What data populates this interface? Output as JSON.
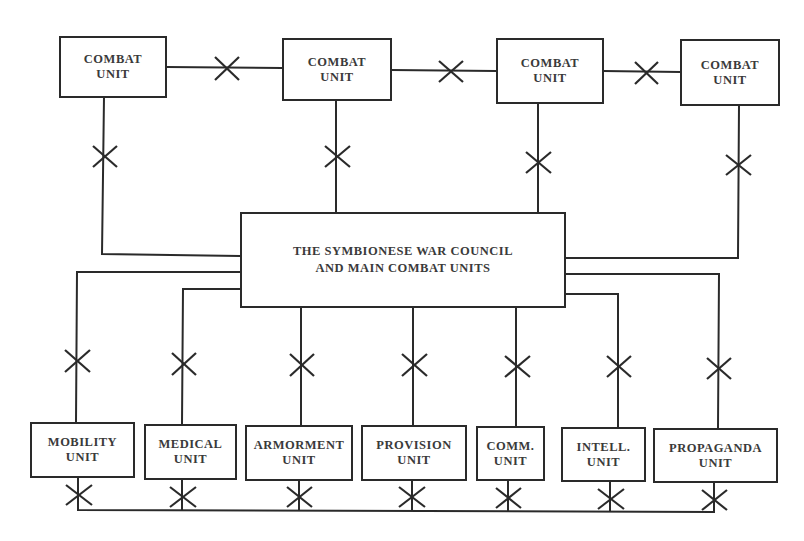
{
  "diagram": {
    "type": "organizational-network",
    "connector_symbol": "X (cut-out / severed link)",
    "colors": {
      "line": "#2a2a2a",
      "text": "#3a3a3a",
      "background": "#ffffff"
    },
    "center": {
      "label": "THE SYMBIONESE WAR COUNCIL\nAND MAIN COMBAT UNITS"
    },
    "combat_units": [
      {
        "label": "COMBAT\nUNIT"
      },
      {
        "label": "COMBAT\nUNIT"
      },
      {
        "label": "COMBAT\nUNIT"
      },
      {
        "label": "COMBAT\nUNIT"
      }
    ],
    "support_units": [
      {
        "label": "MOBILITY\nUNIT"
      },
      {
        "label": "MEDICAL\nUNIT"
      },
      {
        "label": "ARMORMENT\nUNIT"
      },
      {
        "label": "PROVISION\nUNIT"
      },
      {
        "label": "COMM.\nUNIT"
      },
      {
        "label": "INTELL.\nUNIT"
      },
      {
        "label": "PROPAGANDA\nUNIT"
      }
    ]
  }
}
